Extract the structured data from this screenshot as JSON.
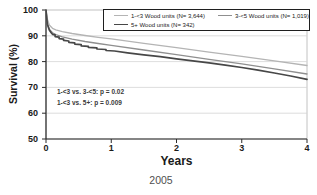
{
  "figure": {
    "caption": "2005"
  },
  "chart_data": {
    "type": "line",
    "subtype": "kaplan-meier-survival",
    "title": "",
    "xlabel": "Years",
    "ylabel": "Survival (%)",
    "xlim": [
      0,
      4
    ],
    "ylim": [
      50,
      100
    ],
    "x_ticks": [
      0,
      1,
      2,
      3,
      4
    ],
    "y_ticks": [
      100,
      90,
      80,
      70,
      60,
      50
    ],
    "grid_y": [
      90,
      80,
      70,
      60
    ],
    "grid": "horizontal-light",
    "legend_position": "top-inside-boxed",
    "colors": {
      "grid": "#d4d4d4",
      "frame": "#c2c2c2",
      "axis": "#2b2b2b",
      "text": "#1a1a1a",
      "caption": "#4f4f4f"
    },
    "series": [
      {
        "name": "1-<3 Wood units (N= 3,644)",
        "color": "#b4b4b4",
        "stroke_width": 1.3,
        "x": [
          0,
          0.02,
          0.05,
          0.1,
          0.15,
          0.25,
          0.4,
          0.6,
          0.8,
          1,
          1.5,
          2,
          2.5,
          3,
          3.5,
          4
        ],
        "y": [
          100,
          96.5,
          94.2,
          92.9,
          92.3,
          91.6,
          90.9,
          90.1,
          89.4,
          88.8,
          87.1,
          85.4,
          83.7,
          82,
          80.3,
          78.5
        ]
      },
      {
        "name": "3-<5 Wood units (N= 1,019)",
        "color": "#8f8f8f",
        "stroke_width": 1.3,
        "x": [
          0,
          0.02,
          0.05,
          0.1,
          0.15,
          0.25,
          0.4,
          0.6,
          0.8,
          1,
          1.5,
          2,
          2.5,
          3,
          3.5,
          4
        ],
        "y": [
          100,
          95,
          92.6,
          91.2,
          90.5,
          89.6,
          88.7,
          87.8,
          87,
          86.3,
          84.5,
          82.7,
          80.9,
          79.1,
          77.2,
          75.2
        ]
      },
      {
        "name": "5+ Wood units (N= 342)",
        "color": "#474747",
        "stroke_width": 1.7,
        "x": [
          0,
          0.02,
          0.05,
          0.08,
          0.1,
          0.14,
          0.14,
          0.2,
          0.2,
          0.27,
          0.27,
          0.35,
          0.35,
          0.44,
          0.44,
          0.54,
          0.54,
          0.65,
          0.65,
          0.78,
          0.78,
          0.92,
          0.92,
          1.05,
          1.25,
          1.5,
          1.75,
          2,
          2.25,
          2.5,
          2.75,
          3,
          3.25,
          3.5,
          3.75,
          4
        ],
        "y": [
          100,
          94.5,
          92.3,
          91.2,
          90.6,
          90.4,
          89.7,
          89.5,
          88.9,
          88.7,
          88.2,
          88,
          87.5,
          87.3,
          86.8,
          86.6,
          86.1,
          85.9,
          85.5,
          85.3,
          84.9,
          84.7,
          84.3,
          84.1,
          83.4,
          82.6,
          81.9,
          81.1,
          80.3,
          79.5,
          78.6,
          77.7,
          76.7,
          75.6,
          74.4,
          73.1
        ]
      }
    ],
    "annotations": [
      "1-<3 vs. 3-<5: p = 0.02",
      "1-<3 vs. 5+: p = 0.009"
    ]
  }
}
